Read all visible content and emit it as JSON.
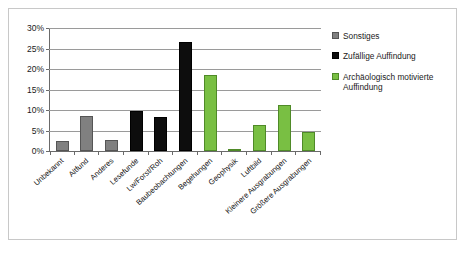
{
  "chart_data": {
    "type": "bar",
    "title": "",
    "subtitle": "",
    "xlabel": "",
    "ylabel": "",
    "ylim": [
      0,
      30
    ],
    "ytick_labels": [
      "0%",
      "5%",
      "10%",
      "15%",
      "20%",
      "25%",
      "30%"
    ],
    "ytick_values": [
      0,
      5,
      10,
      15,
      20,
      25,
      30
    ],
    "grid": true,
    "legend_position": "right",
    "categories": [
      "Unbekannt",
      "Altfund",
      "Anderes",
      "Lesefunde",
      "Lw/Forst/Roh",
      "Baubeobachtungen",
      "Begehungen",
      "Geophysik",
      "Luftbild",
      "Kleinere Ausgrabungen",
      "Größere Ausgrabungen"
    ],
    "series": [
      {
        "name": "Sonstiges",
        "color": "#808080",
        "values": [
          2.4,
          8.5,
          2.6,
          null,
          null,
          null,
          null,
          null,
          null,
          null,
          null
        ]
      },
      {
        "name": "Zufällige Auffindung",
        "color": "#0d0d0d",
        "values": [
          null,
          null,
          null,
          9.8,
          8.4,
          26.5,
          null,
          null,
          null,
          null,
          null
        ]
      },
      {
        "name": "Archäologisch motivierte Auffindung",
        "color": "#79bf43",
        "values": [
          null,
          null,
          null,
          null,
          null,
          null,
          18.6,
          0.3,
          6.3,
          11.3,
          4.7
        ]
      }
    ],
    "bars": [
      {
        "category": "Unbekannt",
        "value": 2.4,
        "series": "Sonstiges"
      },
      {
        "category": "Altfund",
        "value": 8.5,
        "series": "Sonstiges"
      },
      {
        "category": "Anderes",
        "value": 2.6,
        "series": "Sonstiges"
      },
      {
        "category": "Lesefunde",
        "value": 9.8,
        "series": "Zufällige Auffindung"
      },
      {
        "category": "Lw/Forst/Roh",
        "value": 8.4,
        "series": "Zufällige Auffindung"
      },
      {
        "category": "Baubeobachtungen",
        "value": 26.5,
        "series": "Zufällige Auffindung"
      },
      {
        "category": "Begehungen",
        "value": 18.6,
        "series": "Archäologisch motivierte Auffindung"
      },
      {
        "category": "Geophysik",
        "value": 0.3,
        "series": "Archäologisch motivierte Auffindung"
      },
      {
        "category": "Luftbild",
        "value": 6.3,
        "series": "Archäologisch motivierte Auffindung"
      },
      {
        "category": "Kleinere Ausgrabungen",
        "value": 11.3,
        "series": "Archäologisch motivierte Auffindung"
      },
      {
        "category": "Größere Ausgrabungen",
        "value": 4.7,
        "series": "Archäologisch motivierte Auffindung"
      }
    ]
  },
  "legend": {
    "items": [
      {
        "label": "Sonstiges",
        "color": "#808080"
      },
      {
        "label": "Zufällige Auffindung",
        "color": "#0d0d0d"
      },
      {
        "label": "Archäologisch motivierte Auffindung",
        "color": "#79bf43"
      }
    ]
  }
}
